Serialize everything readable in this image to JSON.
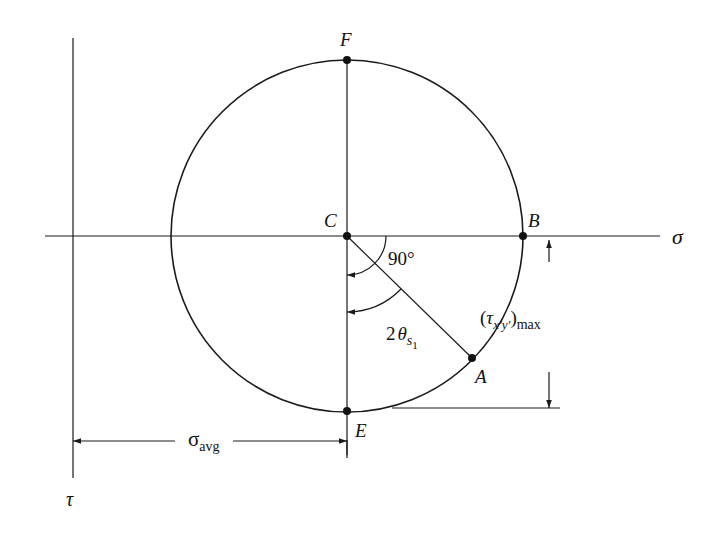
{
  "diagram": {
    "type": "mohr-circle",
    "axes": {
      "horizontal_label": "σ",
      "vertical_label": "τ"
    },
    "points": {
      "F": "F",
      "C": "C",
      "B": "B",
      "A": "A",
      "E": "E"
    },
    "angles": {
      "right_angle": "90°",
      "two_theta_prefix": "2",
      "two_theta_symbol": "θ",
      "two_theta_sub": "s",
      "two_theta_subsub": "1"
    },
    "dimensions": {
      "sigma_avg_symbol": "σ",
      "sigma_avg_sub": "avg",
      "tau_max_open": "(",
      "tau_max_symbol": "τ",
      "tau_max_sub": "x′y′",
      "tau_max_close": ")",
      "tau_max_suffix": "max"
    },
    "colors": {
      "line": "#1a1a1a",
      "background": "#ffffff"
    }
  }
}
